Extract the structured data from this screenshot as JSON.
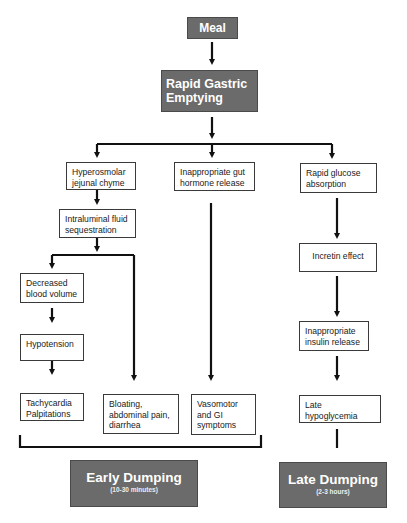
{
  "diagram": {
    "top": {
      "meal": "Meal",
      "rapid_gastric_emptying": "Rapid Gastric Emptying"
    },
    "columns": {
      "left": {
        "hyperosmolar": "Hyperosmolar jejunal chyme",
        "fluid_sequestration": "Intraluminal fluid sequestration",
        "decreased_blood_volume": "Decreased blood volume",
        "hypotension": "Hypotension",
        "tachycardia": "Tachycardia Palpitations",
        "bloating": "Bloating, abdominal pain, diarrhea"
      },
      "middle": {
        "gut_hormone": "Inappropriate gut hormone release",
        "vasomotor": "Vasomotor and GI symptoms"
      },
      "right": {
        "glucose_absorption": "Rapid glucose absorption",
        "incretin": "Incretin effect",
        "insulin_release": "Inappropriate insulin release",
        "late_hypoglycemia": "Late hypoglycemia"
      }
    },
    "outcomes": {
      "early": {
        "title": "Early Dumping",
        "subtitle": "(10-30 minutes)"
      },
      "late": {
        "title": "Late Dumping",
        "subtitle": "(2-3 hours)"
      }
    },
    "colors": {
      "dark_box": "#6b6b6b",
      "line": "#111111",
      "box_border": "#3a3a3a"
    }
  }
}
